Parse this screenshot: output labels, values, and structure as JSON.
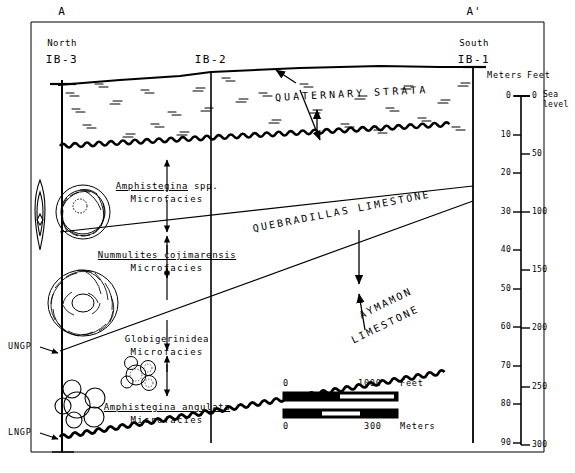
{
  "figure": {
    "line_left_label": "A",
    "line_right_label": "A'",
    "direction_left": "North",
    "direction_right": "South"
  },
  "wells": [
    {
      "name": "IB-3",
      "direction": "North",
      "x": 62
    },
    {
      "name": "IB-2",
      "direction": "",
      "x": 211
    },
    {
      "name": "IB-1",
      "direction": "South",
      "x": 473
    }
  ],
  "units": [
    {
      "name": "QUATERNARY STRATA",
      "style": "upper"
    },
    {
      "name": "QUEBRADILLAS LIMESTONE",
      "style": "middle"
    },
    {
      "name": "AYMAMON",
      "name2": "LIMESTONE",
      "style": "lower"
    }
  ],
  "microfacies": [
    {
      "taxon": "Amphistegina",
      "qualifier": " spp.",
      "sub": "Microfacies"
    },
    {
      "taxon": "Nummulites cojimarensis",
      "qualifier": "",
      "sub": "Microfacies"
    },
    {
      "taxon": "Globigerinidea",
      "qualifier": "",
      "sub": "Microfacies",
      "underline": false
    },
    {
      "taxon": "Amphistegina angulata",
      "qualifier": "",
      "sub": "Microfacies"
    }
  ],
  "picks": [
    {
      "label": "UNGP",
      "y": 351
    },
    {
      "label": "LNGP",
      "y": 437
    }
  ],
  "depth_scale": {
    "header_meters": "Meters",
    "header_feet": "Feet",
    "sea_level_note_line1": "Sea",
    "sea_level_note_line2": "level",
    "meters_ticks": [
      "0",
      "10",
      "20",
      "30",
      "40",
      "50",
      "60",
      "70",
      "80",
      "90"
    ],
    "feet_ticks": [
      "0",
      "50",
      "100",
      "150",
      "200",
      "250",
      "300"
    ]
  },
  "bar_scales": [
    {
      "min": "0",
      "max": "1000",
      "unit": "Feet",
      "label_on_top": true
    },
    {
      "min": "0",
      "max": "300",
      "unit": "Meters",
      "label_on_top": false
    }
  ],
  "fossils": [
    {
      "name": "lens-shaped-foram"
    },
    {
      "name": "spiral-foram-amphistegina"
    },
    {
      "name": "large-nummulites-foram"
    },
    {
      "name": "globigerinid-foram-a"
    },
    {
      "name": "globigerinid-foram-b"
    }
  ],
  "colors": {
    "ink": "#000000",
    "paper": "#ffffff"
  }
}
